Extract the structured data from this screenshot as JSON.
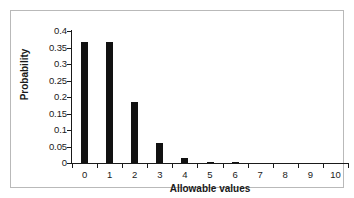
{
  "chart_data": {
    "type": "bar",
    "title": "",
    "xlabel": "Allowable values",
    "ylabel": "Probability",
    "categories": [
      "0",
      "1",
      "2",
      "3",
      "4",
      "5",
      "6",
      "7",
      "8",
      "9",
      "10"
    ],
    "values": [
      0.368,
      0.368,
      0.184,
      0.061,
      0.015,
      0.003,
      0.001,
      0.0,
      0.0,
      0.0,
      0.0
    ],
    "ylim": [
      0,
      0.4
    ],
    "ytick_labels": [
      "0",
      "0.05",
      "0.1",
      "0.15",
      "0.2",
      "0.25",
      "0.3",
      "0.35",
      "0.4"
    ],
    "ytick_values": [
      0,
      0.05,
      0.1,
      0.15,
      0.2,
      0.25,
      0.3,
      0.35,
      0.4
    ],
    "xtick_labels": [
      "0",
      "1",
      "2",
      "3",
      "4",
      "5",
      "6",
      "7",
      "8",
      "9",
      "10"
    ],
    "grid": false,
    "legend": false,
    "bar_color": "#111111",
    "axis_color": "#1a1a1a",
    "frame_color": "#b9b9b9",
    "background": "#ffffff"
  }
}
